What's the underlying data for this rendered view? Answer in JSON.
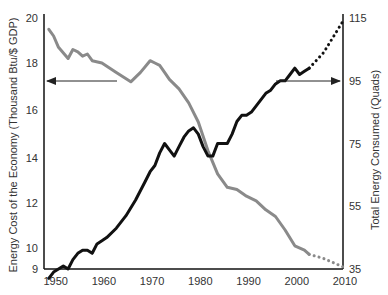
{
  "chart_data": {
    "type": "line",
    "title": "",
    "xlabel": "",
    "ylabel_left": "Energy Cost of the Economy (Thousand Btu/$ GDP)",
    "ylabel_right": "Total Energy Consumed (Quads)",
    "xlim": [
      1948,
      2010
    ],
    "ylim_left": [
      9,
      20
    ],
    "ylim_right": [
      35,
      115
    ],
    "x_ticks": [
      "1950",
      "1960",
      "1970",
      "1980",
      "1990",
      "2000",
      "2010"
    ],
    "y_ticks_left": [
      "9",
      "10",
      "12",
      "14",
      "16",
      "18",
      "20"
    ],
    "y_ticks_right": [
      "35",
      "55",
      "75",
      "95",
      "115"
    ],
    "grid": false,
    "series": [
      {
        "name": "Energy Cost of the Economy",
        "axis": "left",
        "color": "#8a8a8a",
        "style": "solid",
        "x": [
          1949,
          1950,
          1951,
          1953,
          1954,
          1955,
          1956,
          1957,
          1958,
          1960,
          1963,
          1966,
          1968,
          1970,
          1971,
          1972,
          1973,
          1974,
          1976,
          1978,
          1980,
          1982,
          1984,
          1986,
          1988,
          1990,
          1992,
          1994,
          1996,
          1998,
          2000,
          2002,
          2003
        ],
        "values": [
          19.5,
          19.2,
          18.7,
          18.2,
          18.6,
          18.5,
          18.3,
          18.4,
          18.1,
          18.0,
          17.6,
          17.2,
          17.6,
          18.1,
          18.0,
          17.9,
          17.6,
          17.3,
          16.9,
          16.3,
          15.5,
          14.3,
          13.3,
          12.7,
          12.6,
          12.3,
          12.1,
          11.7,
          11.4,
          10.8,
          10.1,
          9.9,
          9.7
        ]
      },
      {
        "name": "Energy Cost of the Economy (projected)",
        "axis": "left",
        "color": "#8a8a8a",
        "style": "dotted",
        "x": [
          2003,
          2006,
          2010
        ],
        "values": [
          9.7,
          9.5,
          9.1
        ]
      },
      {
        "name": "Total Energy Consumed",
        "axis": "right",
        "color": "#111111",
        "style": "solid",
        "x": [
          1949,
          1950,
          1951,
          1952,
          1953,
          1954,
          1955,
          1956,
          1957,
          1958,
          1959,
          1960,
          1961,
          1963,
          1965,
          1967,
          1969,
          1970,
          1971,
          1972,
          1973,
          1974,
          1975,
          1976,
          1977,
          1978,
          1979,
          1980,
          1981,
          1982,
          1983,
          1984,
          1985,
          1986,
          1987,
          1988,
          1989,
          1990,
          1991,
          1992,
          1993,
          1994,
          1995,
          1996,
          1997,
          1998,
          1999,
          2000,
          2001,
          2002,
          2003
        ],
        "values": [
          32,
          34,
          35,
          36,
          35,
          38,
          40,
          41,
          41,
          40,
          43,
          44,
          45,
          48,
          52,
          57,
          63,
          66,
          68,
          72,
          75,
          73,
          71,
          74,
          77,
          79,
          80,
          78,
          74,
          71,
          71,
          75,
          75,
          75,
          78,
          82,
          84,
          84,
          85,
          87,
          89,
          91,
          92,
          94,
          95,
          95,
          97,
          99,
          97,
          98,
          99
        ]
      },
      {
        "name": "Total Energy Consumed (projected)",
        "axis": "right",
        "color": "#111111",
        "style": "dotted",
        "x": [
          2003,
          2006,
          2010
        ],
        "values": [
          99,
          104,
          114
        ]
      }
    ],
    "annotations": [
      {
        "type": "arrow",
        "direction": "left",
        "points_to": "left axis",
        "from_year": 1964,
        "y_left": 17.3
      },
      {
        "type": "arrow",
        "direction": "right",
        "points_to": "right axis",
        "from_year": 1990,
        "y_right": 95
      }
    ]
  }
}
